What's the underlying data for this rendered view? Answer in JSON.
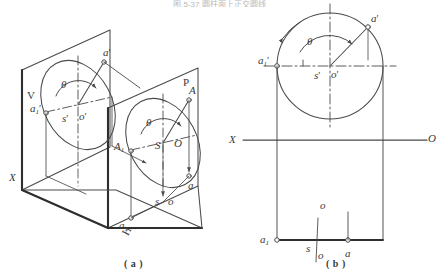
{
  "page": {
    "title_strip": "图 5-37  圆柱面上正交圆线",
    "background": "#ffffff",
    "ink": "#3a3a3a",
    "width": 439,
    "height": 277
  },
  "figure": {
    "caption_a": "( a )",
    "caption_b": "( b )"
  },
  "diagram_a": {
    "name": "axonometric-projection-view",
    "planes": [
      {
        "id": "v-plane",
        "label": "V"
      },
      {
        "id": "p-plane",
        "label": "P"
      },
      {
        "id": "h-plane",
        "label": "H"
      }
    ],
    "axis_label": "X",
    "labels": {
      "a_prime_v": "a",
      "a_prime_v_prime": "′",
      "a1_prime_v": "a",
      "a1_prime_v_sub": "1",
      "a1_prime_v_prime": "′",
      "s_prime_v": "s",
      "s_prime_v_prime": "′",
      "o_prime_v": "o",
      "o_prime_v_prime": "′",
      "theta_v": "θ",
      "A_p": "A",
      "A1_p": "A",
      "A1_p_sub": "1",
      "S_p": "S",
      "O_p": "O",
      "theta_p": "θ",
      "a_h": "a",
      "a1_h": "a",
      "a1_h_sub": "1",
      "s_h": "s",
      "o_h": "o",
      "h_plane": "H"
    }
  },
  "diagram_b": {
    "name": "orthographic-projection-view",
    "ground_line": {
      "left_label": "X",
      "right_label": "O"
    },
    "labels": {
      "a_prime": "a",
      "a_prime_mark": "′",
      "a1_prime": "a",
      "a1_prime_sub": "1",
      "a1_prime_mark": "′",
      "s_prime": "s",
      "s_prime_mark": "′",
      "o_prime": "o",
      "o_prime_mark": "′",
      "theta": "θ",
      "a_h": "a",
      "a1_h": "a",
      "a1_h_sub": "1",
      "s_h": "s",
      "o_top": "o",
      "o_bottom": "o"
    }
  }
}
